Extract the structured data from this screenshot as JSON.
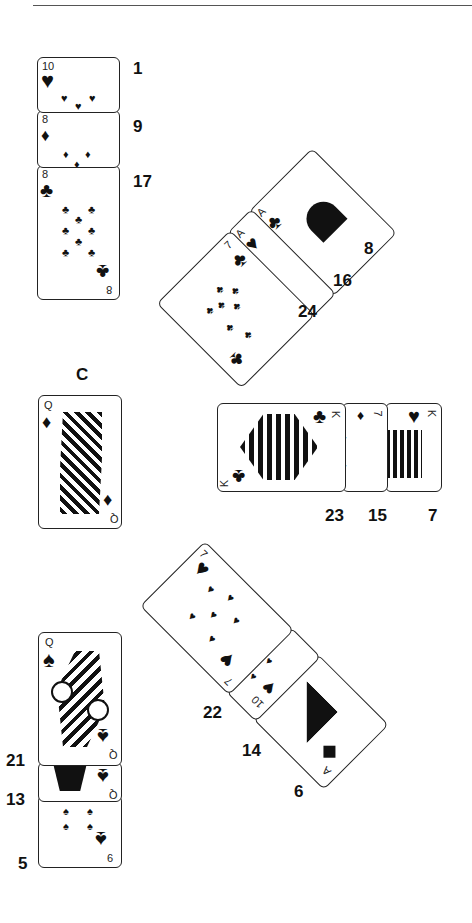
{
  "figure": {
    "title_rule": true,
    "groups": [
      {
        "name": "top-left-column",
        "cards": [
          {
            "rank": "10",
            "suit": "hearts",
            "suit_glyph": "♥",
            "position_label": "1"
          },
          {
            "rank": "8",
            "suit": "diamonds",
            "suit_glyph": "♦",
            "position_label": "9"
          },
          {
            "rank": "8",
            "suit": "clubs",
            "suit_glyph": "♣",
            "position_label": "17"
          }
        ]
      },
      {
        "name": "upper-diagonal",
        "cards": [
          {
            "rank": "A",
            "suit": "clubs",
            "suit_glyph": "♣",
            "position_label": "8"
          },
          {
            "rank": "A",
            "suit": "hearts",
            "suit_glyph": "♥",
            "position_label": "16"
          },
          {
            "rank": "7",
            "suit": "clubs",
            "suit_glyph": "♣",
            "position_label": "24"
          }
        ]
      },
      {
        "name": "single-card",
        "cards": [
          {
            "rank": "Q",
            "suit": "diamonds",
            "suit_glyph": "♦",
            "position_label": "C"
          }
        ]
      },
      {
        "name": "king-row",
        "cards": [
          {
            "rank": "K",
            "suit": "clubs",
            "suit_glyph": "♣",
            "position_label": "23"
          },
          {
            "rank": "7",
            "suit": "diamonds",
            "suit_glyph": "♦",
            "position_label": "15"
          },
          {
            "rank": "K",
            "suit": "hearts",
            "suit_glyph": "♥",
            "position_label": "7"
          }
        ]
      },
      {
        "name": "lower-diagonal",
        "cards": [
          {
            "rank": "7",
            "suit": "hearts",
            "suit_glyph": "♥",
            "position_label": "22"
          },
          {
            "rank": "10",
            "suit": "hearts",
            "suit_glyph": "♥",
            "position_label": "14"
          },
          {
            "rank": "A",
            "suit": "diamonds",
            "suit_glyph": "♦",
            "position_label": "6"
          }
        ]
      },
      {
        "name": "bottom-left-column",
        "cards": [
          {
            "rank": "Q",
            "suit": "spades",
            "suit_glyph": "♠",
            "position_label": "21"
          },
          {
            "rank": "Q",
            "suit": "spades",
            "suit_glyph": "♠",
            "position_label": "13"
          },
          {
            "rank": "6",
            "suit": "spades",
            "suit_glyph": "♠",
            "position_label": "5"
          }
        ]
      }
    ]
  }
}
